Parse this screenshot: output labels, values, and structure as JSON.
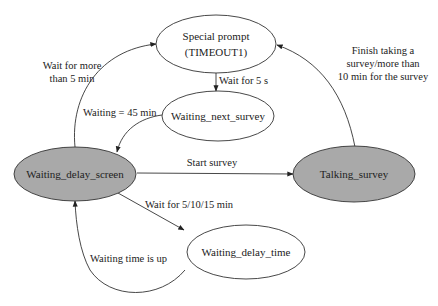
{
  "diagram": {
    "type": "state-machine",
    "colors": {
      "background": "#ffffff",
      "stroke": "#333333",
      "shaded_fill": "#a9a9a9",
      "plain_fill": "#ffffff",
      "text": "#222222"
    },
    "nodes": {
      "special_prompt": {
        "line1": "Special prompt",
        "line2": "(TIMEOUT1)",
        "shaded": false
      },
      "waiting_next_survey": {
        "label": "Waiting_next_survey",
        "shaded": false
      },
      "waiting_delay_screen": {
        "label": "Waiting_delay_screen",
        "shaded": true
      },
      "talking_survey": {
        "label": "Talking_survey",
        "shaded": true
      },
      "waiting_delay_time": {
        "label": "Waiting_delay_time",
        "shaded": false
      }
    },
    "edges": {
      "screen_to_prompt": {
        "from": "Waiting_delay_screen",
        "to": "Special prompt",
        "line1": "Wait for more",
        "line2": "than 5 min"
      },
      "prompt_to_next": {
        "from": "Special prompt",
        "to": "Waiting_next_survey",
        "label": "Wait for 5 s"
      },
      "next_to_screen": {
        "from": "Waiting_next_survey",
        "to": "Waiting_delay_screen",
        "label": "Waiting = 45 min"
      },
      "screen_to_talking": {
        "from": "Waiting_delay_screen",
        "to": "Talking_survey",
        "label": "Start survey"
      },
      "talking_to_prompt": {
        "from": "Talking_survey",
        "to": "Special prompt",
        "line1": "Finish taking a",
        "line2": "survey/more than",
        "line3": "10 min for the survey"
      },
      "screen_to_delay_time": {
        "from": "Waiting_delay_screen",
        "to": "Waiting_delay_time",
        "label": "Wait for 5/10/15 min"
      },
      "delay_time_to_screen": {
        "from": "Waiting_delay_time",
        "to": "Waiting_delay_screen",
        "label": "Waiting time is up"
      }
    }
  }
}
